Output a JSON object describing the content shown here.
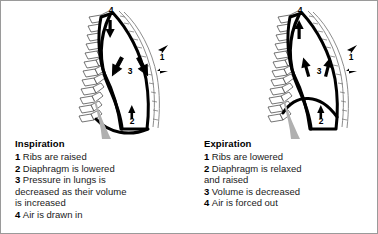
{
  "figure": {
    "border_color": "#9a9a9a",
    "background": "#ffffff",
    "ink_color": "#000000",
    "diaphragm_shade": "#b0b0b0"
  },
  "panels": [
    {
      "id": "inspiration",
      "title": "Inspiration",
      "diagram": {
        "name": "thorax-inspiration-diagram",
        "labels": [
          {
            "key": "4",
            "meaning": "air-in-arrow",
            "x": 110,
            "y": 12
          },
          {
            "key": "1",
            "meaning": "ribs-raised-arrows",
            "x": 161,
            "y": 59
          },
          {
            "key": "3",
            "meaning": "pressure-decrease-arrows",
            "x": 129,
            "y": 73
          },
          {
            "key": "2",
            "meaning": "diaphragm-lowered-arrow",
            "x": 131,
            "y": 123
          }
        ]
      },
      "items": [
        {
          "num": "1",
          "text": "Ribs are raised"
        },
        {
          "num": "2",
          "text": "Diaphragm is lowered"
        },
        {
          "num": "3",
          "text": "Pressure in lungs is\ndecreased as their volume\nis increased"
        },
        {
          "num": "4",
          "text": "Air is drawn in"
        }
      ]
    },
    {
      "id": "expiration",
      "title": "Expiration",
      "diagram": {
        "name": "thorax-expiration-diagram",
        "labels": [
          {
            "key": "4",
            "meaning": "air-out-arrow",
            "x": 110,
            "y": 12
          },
          {
            "key": "1",
            "meaning": "ribs-lowered-arrows",
            "x": 161,
            "y": 59
          },
          {
            "key": "3",
            "meaning": "volume-decrease-arrows",
            "x": 129,
            "y": 73
          },
          {
            "key": "2",
            "meaning": "diaphragm-raised-arrow",
            "x": 131,
            "y": 123
          }
        ]
      },
      "items": [
        {
          "num": "1",
          "text": "Ribs are lowered"
        },
        {
          "num": "2",
          "text": "Diaphragm is relaxed\nand raised"
        },
        {
          "num": "3",
          "text": "Volume is decreased"
        },
        {
          "num": "4",
          "text": "Air is forced out"
        }
      ]
    }
  ]
}
